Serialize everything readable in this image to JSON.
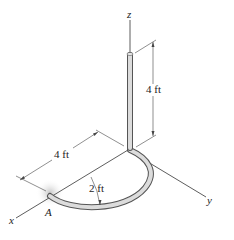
{
  "figure": {
    "axes": {
      "x_label": "x",
      "y_label": "y",
      "z_label": "z"
    },
    "point_label": "A",
    "dimensions": {
      "vertical_rod_length": "4 ft",
      "straight_segment_length": "4 ft",
      "radius": "2 ft"
    },
    "colors": {
      "rod_fill": "#d9d9d9",
      "rod_outline": "#555555",
      "line": "#333333"
    }
  }
}
